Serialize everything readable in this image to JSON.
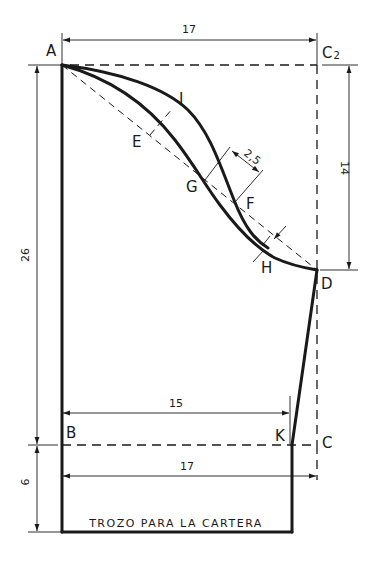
{
  "points": {
    "A": "A",
    "C2_main": "C",
    "C2_sub": "2",
    "I": "I",
    "E": "E",
    "G": "G",
    "F": "F",
    "H": "H",
    "D": "D",
    "B": "B",
    "K": "K",
    "C": "C"
  },
  "dimensions": {
    "top_width": "17",
    "left_height": "26",
    "left_bottom": "6",
    "right_height": "14",
    "curve_offset": "2,5",
    "waist_width": "15",
    "bottom_width": "17"
  },
  "caption": "TROZO PARA LA CARTERA",
  "colors": {
    "line": "#1a1a1a",
    "background": "#ffffff"
  }
}
